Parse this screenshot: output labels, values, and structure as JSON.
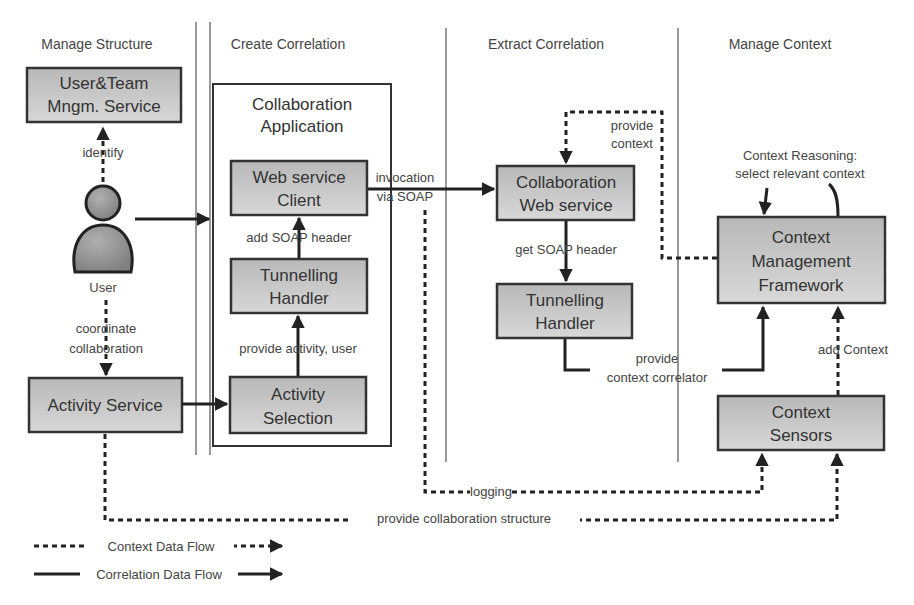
{
  "lanes": {
    "manage_structure": "Manage Structure",
    "create_correlation": "Create Correlation",
    "extract_correlation": "Extract Correlation",
    "manage_context": "Manage Context"
  },
  "nodes": {
    "user_team": [
      "User&Team",
      "Mngm.  Service"
    ],
    "user": "User",
    "activity_service": "Activity Service",
    "collab_app": [
      "Collaboration",
      "Application"
    ],
    "ws_client": [
      "Web service",
      "Client"
    ],
    "tunnel_client": [
      "Tunnelling",
      "Handler"
    ],
    "activity_selection": [
      "Activity",
      "Selection"
    ],
    "collab_ws": [
      "Collaboration",
      "Web service"
    ],
    "tunnel_server": [
      "Tunnelling",
      "Handler"
    ],
    "cmf": [
      "Context",
      "Management",
      "Framework"
    ],
    "sensors": [
      "Context",
      "Sensors"
    ]
  },
  "edges": {
    "identify": "identify",
    "coordinate": [
      "coordinate",
      "collaboration"
    ],
    "add_soap_header": "add SOAP header",
    "provide_activity": "provide activity, user",
    "invocation": [
      "invocation",
      "via SOAP"
    ],
    "get_soap_header": "get SOAP header",
    "provide_context": [
      "provide",
      "context"
    ],
    "reasoning": [
      "Context Reasoning:",
      "select relevant context"
    ],
    "provide_correlator": [
      "provide",
      "context correlator"
    ],
    "add_context": "add Context",
    "logging": "logging",
    "provide_structure": "provide collaboration structure"
  },
  "legend": {
    "context_flow": "Context Data Flow",
    "correlation_flow": "Correlation Data Flow"
  }
}
